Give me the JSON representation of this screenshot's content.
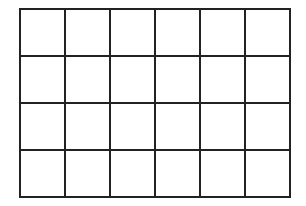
{
  "grid": {
    "rows": 4,
    "cols": 6,
    "left": 20,
    "top": 9,
    "cell_width": 45,
    "cell_height": 47,
    "line_color": "#222222",
    "line_width": 2,
    "background": "#ffffff"
  }
}
